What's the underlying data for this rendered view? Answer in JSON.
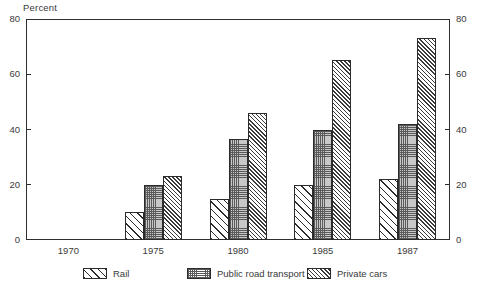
{
  "chart_data": {
    "type": "bar",
    "title": "",
    "subtitle": "",
    "xlabel": "",
    "ylabel": "Percent",
    "ylim": [
      0,
      80
    ],
    "yticks": [
      0,
      20,
      40,
      60,
      80
    ],
    "ytick_labels": [
      "0",
      "20",
      "40",
      "60",
      "80"
    ],
    "right_axis_mirrored": true,
    "right_ytick_labels": [
      "0",
      "20",
      "40",
      "60",
      "80"
    ],
    "grid": false,
    "legend_position": "bottom",
    "categories": [
      "1970",
      "1975",
      "1980",
      "1985",
      "1987"
    ],
    "series": [
      {
        "name": "Rail",
        "pattern": "diagonal-hatch-sparse",
        "color": "#ffffff",
        "values": [
          null,
          10,
          15,
          20,
          22
        ]
      },
      {
        "name": "Public road transport",
        "pattern": "stipple-dots",
        "color": "#c8c8c8",
        "values": [
          null,
          20,
          36.5,
          40,
          42
        ]
      },
      {
        "name": "Private cars",
        "pattern": "diagonal-hatch-dense",
        "color": "#9a9a9a",
        "values": [
          null,
          23,
          46,
          65,
          73
        ]
      }
    ]
  },
  "axis": {
    "y_title": "Percent"
  },
  "legend": {
    "items": [
      {
        "label": "Rail"
      },
      {
        "label": "Public road transport"
      },
      {
        "label": "Private cars"
      }
    ]
  },
  "colors": {
    "axis": "#2e2e2e",
    "text": "#3a3a3a",
    "background": "#ffffff",
    "bar_outline": "#2b2b2b",
    "road_fill": "#c8c8c8"
  }
}
